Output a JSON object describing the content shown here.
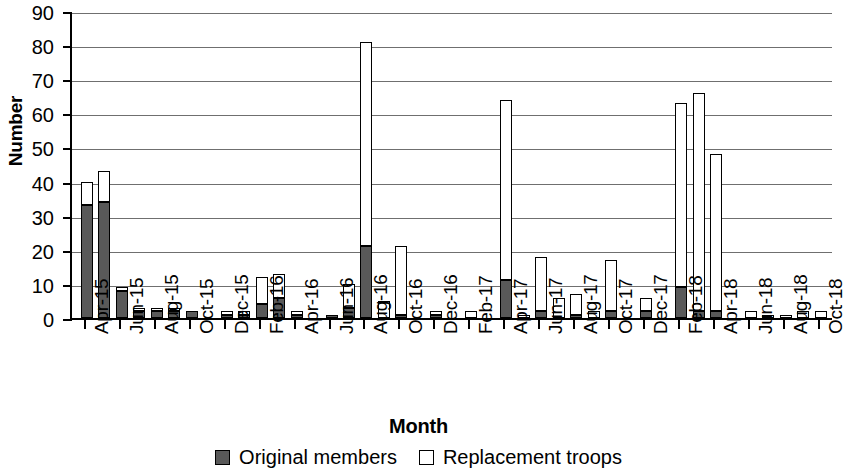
{
  "chart_data": {
    "type": "bar",
    "subtype": "stacked",
    "title": "",
    "xlabel": "Month",
    "ylabel": "Number",
    "ylim": [
      0,
      90
    ],
    "ytick_step": 10,
    "yticks": [
      0,
      10,
      20,
      30,
      40,
      50,
      60,
      70,
      80,
      90
    ],
    "grid": true,
    "legend_position": "bottom",
    "colors": {
      "original": "#595959",
      "replacement": "#ffffff",
      "axis": "#000000",
      "gridline": "#6f6f6f"
    },
    "categories": [
      "Apr-15",
      "May-15",
      "Jun-15",
      "Jul-15",
      "Aug-15",
      "Sep-15",
      "Oct-15",
      "Nov-15",
      "Dec-15",
      "Jan-16",
      "Feb-16",
      "Mar-16",
      "Apr-16",
      "May-16",
      "Jun-16",
      "Jul-16",
      "Aug-16",
      "Sep-16",
      "Oct-16",
      "Nov-16",
      "Dec-16",
      "Jan-17",
      "Feb-17",
      "Mar-17",
      "Apr-17",
      "May-17",
      "Jun-17",
      "Jul-17",
      "Aug-17",
      "Sep-17",
      "Oct-17",
      "Nov-17",
      "Dec-17",
      "Jan-18",
      "Feb-18",
      "Mar-18",
      "Apr-18",
      "May-18",
      "Jun-18",
      "Jul-18",
      "Aug-18",
      "Sep-18",
      "Oct-18"
    ],
    "tick_labels": [
      "Apr-15",
      "Jun-15",
      "Aug-15",
      "Oct-15",
      "Dec-15",
      "Feb-16",
      "Apr-16",
      "Jun-16",
      "Aug-16",
      "Oct-16",
      "Dec-16",
      "Feb-17",
      "Apr-17",
      "Jun-17",
      "Aug-17",
      "Oct-17",
      "Dec-17",
      "Feb-18",
      "Apr-18",
      "Jun-18",
      "Aug-18",
      "Oct-18"
    ],
    "tick_label_indices": [
      0,
      2,
      4,
      6,
      8,
      10,
      12,
      14,
      16,
      18,
      20,
      22,
      24,
      26,
      28,
      30,
      32,
      34,
      36,
      38,
      40,
      42
    ],
    "series": [
      {
        "name": "Original members",
        "key": "original",
        "values": [
          33,
          34,
          8,
          2,
          2,
          2,
          2,
          0,
          1,
          1,
          4,
          6,
          1,
          0,
          1,
          3,
          21,
          0,
          1,
          0,
          1,
          0,
          0,
          0,
          11,
          0,
          2,
          0,
          1,
          0,
          2,
          0,
          2,
          0,
          9,
          2,
          2,
          0,
          0,
          0,
          0,
          0,
          0
        ]
      },
      {
        "name": "Replacement troops",
        "key": "replacement",
        "values": [
          7,
          9,
          1,
          1,
          1,
          1,
          0,
          0,
          1,
          1,
          8,
          7,
          1,
          0,
          0,
          7,
          60,
          5,
          20,
          0,
          1,
          0,
          2,
          0,
          53,
          1,
          16,
          6,
          6,
          2,
          15,
          0,
          4,
          0,
          54,
          64,
          46,
          0,
          2,
          1,
          1,
          2,
          2
        ]
      }
    ],
    "totals": [
      40,
      43,
      9,
      3,
      3,
      3,
      2,
      0,
      2,
      2,
      12,
      13,
      2,
      0,
      1,
      10,
      81,
      5,
      21,
      0,
      2,
      0,
      2,
      0,
      64,
      1,
      18,
      6,
      7,
      2,
      17,
      0,
      6,
      0,
      63,
      66,
      48,
      0,
      2,
      1,
      1,
      2,
      2
    ]
  },
  "legend": {
    "items": [
      {
        "label": "Original members",
        "key": "original"
      },
      {
        "label": "Replacement troops",
        "key": "replacement"
      }
    ]
  }
}
